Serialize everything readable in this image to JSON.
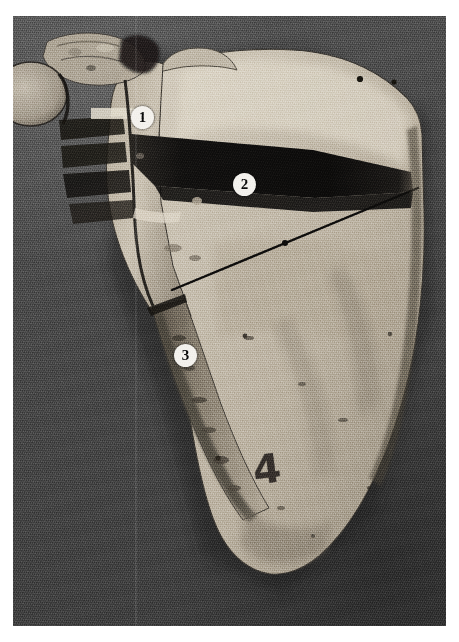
{
  "figure": {
    "kind": "anatomical-specimen-photograph",
    "subject": "scapula",
    "view": "posterior",
    "width_px": 459,
    "height_px": 642,
    "colors": {
      "page_margin": "#ffffff",
      "backdrop_gray": "#4c4c4c",
      "bone_light": "#cfc8ba",
      "bone_mid": "#b3aa9b",
      "bone_shadow": "#6f675b",
      "deep_shadow": "#141414",
      "marker_fill": "#f4f2ee",
      "marker_text": "#0b0b0b",
      "ink": "#241f1c"
    }
  },
  "markers": [
    {
      "id": "marker-1",
      "label": "1",
      "x": 131,
      "y": 102
    },
    {
      "id": "marker-2",
      "label": "2",
      "x": 233,
      "y": 169
    },
    {
      "id": "marker-3",
      "label": "3",
      "x": 174,
      "y": 340
    }
  ],
  "ink_markings": [
    {
      "id": "specimen-number",
      "label": "4",
      "x": 253,
      "y": 452
    }
  ],
  "features": {
    "scan_seam_x": 135,
    "pointer_line": {
      "x1": 172,
      "y1": 290,
      "x2": 418,
      "y2": 188
    },
    "spine_trough": "dark wedge running from medial border to lateral angle",
    "foramina_count": 2
  }
}
